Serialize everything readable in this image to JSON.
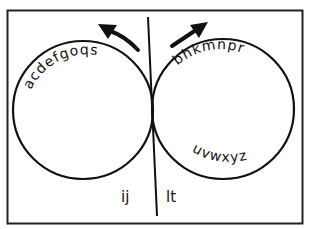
{
  "diagram": {
    "left_circle": {
      "top_letters": "acdefgoqs",
      "bottom_letters": "",
      "outside_label": "ij"
    },
    "right_circle": {
      "top_letters": "bhkmnpr",
      "bottom_letters": "uvwxyz",
      "outside_label": "lt"
    },
    "arrows": {
      "left": "arrow-up-left",
      "right": "arrow-up-right"
    },
    "colors": {
      "stroke": "#111111",
      "background": "#ffffff"
    }
  }
}
